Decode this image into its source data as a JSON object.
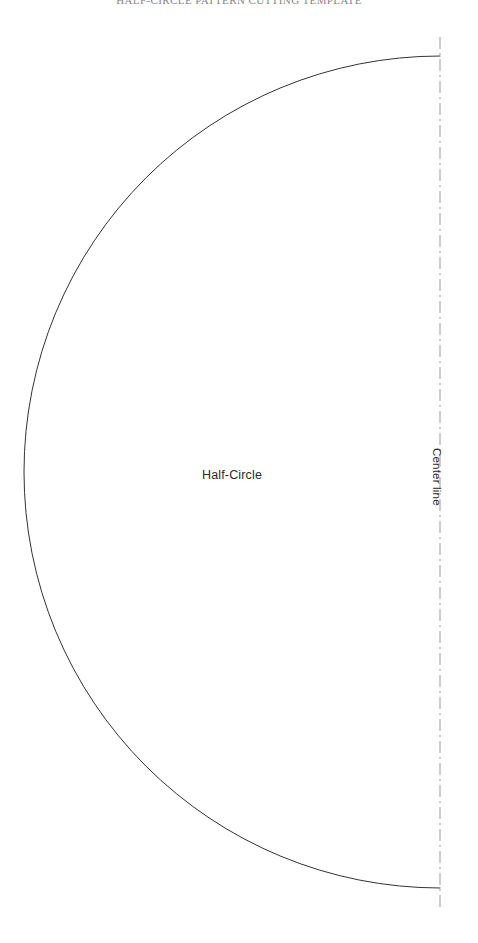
{
  "page": {
    "width": 478,
    "height": 943,
    "background_color": "#ffffff"
  },
  "header": {
    "text": "HALF-CIRCLE PATTERN CUTTING TEMPLATE",
    "color": "#6f6f78",
    "note": "clipped at top edge of image"
  },
  "diagram": {
    "shape_label": "Half-Circle",
    "center_line_label": "Center line",
    "outline_color": "#333333",
    "center_line_color": "#b7b7bb",
    "fill_color": "#ffffff",
    "geometry": {
      "center_x": 440,
      "center_y": 472,
      "radius": 416,
      "arc_start_x": 440,
      "arc_start_y": 56,
      "arc_end_x": 440,
      "arc_end_y": 888,
      "orientation": "opens-right",
      "center_line_x": 440,
      "center_line_top_y": 37,
      "center_line_bottom_y": 910,
      "center_line_dash_pattern": "12 4 2 4"
    }
  }
}
